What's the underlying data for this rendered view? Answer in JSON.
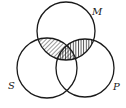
{
  "diagram": {
    "type": "venn",
    "sets": [
      {
        "id": "M",
        "label": "M",
        "cx": 66,
        "cy": 31,
        "r": 29,
        "label_x": 92,
        "label_y": 15
      },
      {
        "id": "S",
        "label": "S",
        "cx": 47,
        "cy": 68,
        "r": 30,
        "label_x": 8,
        "label_y": 89
      },
      {
        "id": "P",
        "label": "P",
        "cx": 85,
        "cy": 68,
        "r": 29,
        "label_x": 114,
        "label_y": 90
      }
    ],
    "shaded_regions": [
      {
        "region": "M∩S (not P)",
        "pattern": "diagonal-hatch"
      },
      {
        "region": "M∩P (not S)",
        "pattern": "vertical-hatch"
      },
      {
        "region": "M∩S∩P",
        "pattern": "cross-hatch"
      }
    ],
    "colors": {
      "stroke": "#1a1a1a",
      "background": "#ffffff"
    }
  }
}
